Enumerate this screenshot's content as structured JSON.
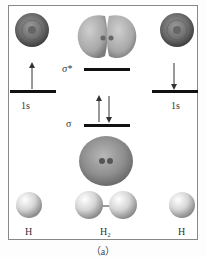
{
  "diagram": {
    "type": "molecular-orbital-energy-diagram",
    "caption": "（a）",
    "levels": {
      "left_atomic": {
        "label": "1s",
        "electron": "up"
      },
      "right_atomic": {
        "label": "1s",
        "electron": "down"
      },
      "antibonding": {
        "label": "σ*",
        "electrons": "none"
      },
      "bonding": {
        "label": "σ",
        "electrons": "up-down pair"
      }
    },
    "atoms": {
      "left": "H",
      "molecule": "H₂",
      "right": "H"
    },
    "colors": {
      "level_line": "#111111",
      "orbital_surface": "#8a8a8a",
      "atom_sphere": "#d8d8d8",
      "frame": "#888888"
    }
  }
}
